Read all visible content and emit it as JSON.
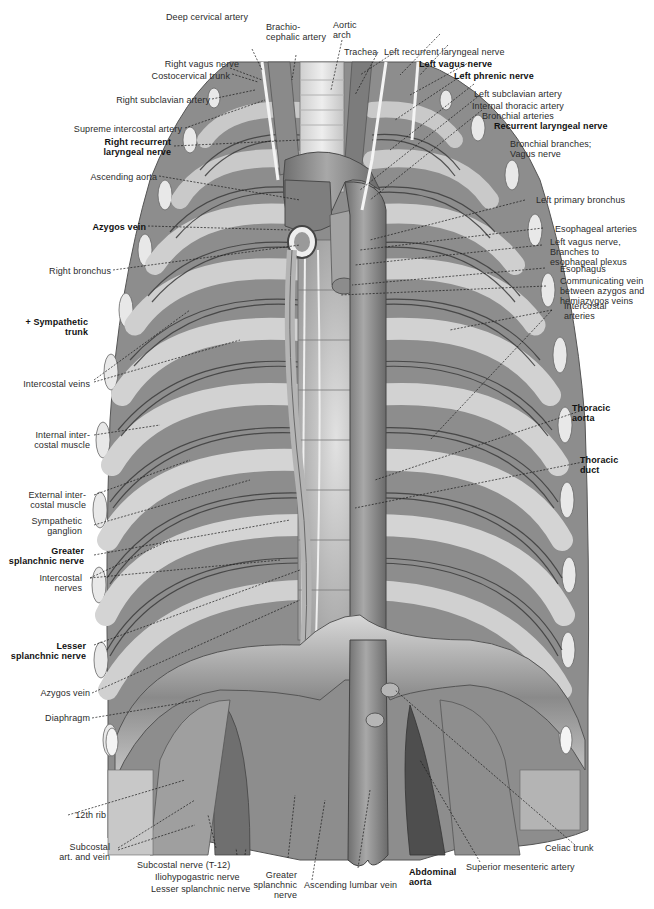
{
  "figure": {
    "colors": {
      "background": "#ffffff",
      "label_text": "#2b2b2b",
      "bold_label_text": "#111111",
      "leader_line": "#1a1a1a",
      "tissue_dark": "#5a5a5a",
      "tissue_mid": "#9a9a9a",
      "tissue_light": "#d4d4d4",
      "vessel": "#8c8c8c",
      "nerve": "#f2f2f2"
    }
  },
  "labels": {
    "top": [
      {
        "id": "deep-cervical-artery",
        "text": "Deep cervical artery",
        "bold": false
      },
      {
        "id": "brachiocephalic-artery",
        "text": "Brachio-\ncephalic artery",
        "bold": false
      },
      {
        "id": "aortic-arch",
        "text": "Aortic\narch",
        "bold": false
      },
      {
        "id": "trachea",
        "text": "Trachea",
        "bold": false
      },
      {
        "id": "left-recurrent-laryngeal-nerve",
        "text": "Left recurrent laryngeal nerve",
        "bold": false
      }
    ],
    "left": [
      {
        "id": "right-vagus-nerve",
        "text": "Right vagus nerve",
        "bold": false
      },
      {
        "id": "costocervical-trunk",
        "text": "Costocervical trunk",
        "bold": false
      },
      {
        "id": "right-subclavian-artery",
        "text": "Right subclavian artery",
        "bold": false
      },
      {
        "id": "supreme-intercostal-artery",
        "text": "Supreme intercostal artery",
        "bold": false
      },
      {
        "id": "right-recurrent-laryngeal-nerve",
        "text": "Right recurrent\nlaryngeal nerve",
        "bold": true
      },
      {
        "id": "ascending-aorta",
        "text": "Ascending aorta",
        "bold": false
      },
      {
        "id": "azygos-vein-upper",
        "text": "Azygos vein",
        "bold": true
      },
      {
        "id": "right-bronchus",
        "text": "Right bronchus",
        "bold": false
      },
      {
        "id": "sympathetic-trunk",
        "text": "+ Sympathetic\ntrunk",
        "bold": true
      },
      {
        "id": "intercostal-veins",
        "text": "Intercostal veins",
        "bold": false
      },
      {
        "id": "internal-intercostal-muscle",
        "text": "Internal inter-\ncostal muscle",
        "bold": false
      },
      {
        "id": "external-intercostal-muscle",
        "text": "External inter-\ncostal muscle",
        "bold": false
      },
      {
        "id": "sympathetic-ganglion",
        "text": "Sympathetic\nganglion",
        "bold": false
      },
      {
        "id": "greater-splanchnic-nerve",
        "text": "Greater\nsplanchnic nerve",
        "bold": true
      },
      {
        "id": "intercostal-nerves",
        "text": "Intercostal\nnerves",
        "bold": false
      },
      {
        "id": "lesser-splanchnic-nerve",
        "text": "Lesser\nsplanchnic nerve",
        "bold": true
      },
      {
        "id": "azygos-vein-lower",
        "text": "Azygos vein",
        "bold": false
      },
      {
        "id": "diaphragm",
        "text": "Diaphragm",
        "bold": false
      },
      {
        "id": "12th-rib",
        "text": "12th rib",
        "bold": false
      },
      {
        "id": "subcostal-art-and-vein",
        "text": "Subcostal\nart. and vein",
        "bold": false
      }
    ],
    "right": [
      {
        "id": "left-vagus-nerve",
        "text": "Left vagus nerve",
        "bold": true
      },
      {
        "id": "left-phrenic-nerve",
        "text": "Left phrenic nerve",
        "bold": true
      },
      {
        "id": "left-subclavian-artery",
        "text": "Left subclavian artery",
        "bold": false
      },
      {
        "id": "internal-thoracic-artery",
        "text": "Internal thoracic artery",
        "bold": false
      },
      {
        "id": "bronchial-arteries",
        "text": "Bronchial arteries",
        "bold": false
      },
      {
        "id": "recurrent-laryngeal-nerve",
        "text": "Recurrent laryngeal nerve",
        "bold": true
      },
      {
        "id": "bronchial-branches-vagus",
        "text": "Bronchial branches;\nVagus nerve",
        "bold": false
      },
      {
        "id": "left-primary-bronchus",
        "text": "Left primary bronchus",
        "bold": false
      },
      {
        "id": "esophageal-arteries",
        "text": "Esophageal arteries",
        "bold": false
      },
      {
        "id": "left-vagus-esophageal-plexus",
        "text": "Left vagus nerve,\nBranches to\nesophageal plexus",
        "bold": false
      },
      {
        "id": "esophagus",
        "text": "Esophagus",
        "bold": false
      },
      {
        "id": "communicating-vein",
        "text": "Communicating vein\nbetween azygos and\nhemiazygos veins",
        "bold": false
      },
      {
        "id": "intercostal-arteries",
        "text": "Intercostal\narteries",
        "bold": false
      },
      {
        "id": "thoracic-aorta",
        "text": "Thoracic\naorta",
        "bold": true
      },
      {
        "id": "thoracic-duct",
        "text": "Thoracic\nduct",
        "bold": true
      },
      {
        "id": "celiac-trunk",
        "text": "Celiac trunk",
        "bold": false
      }
    ],
    "bottom": [
      {
        "id": "subcostal-nerve",
        "text": "Subcostal nerve (T-12)",
        "bold": false
      },
      {
        "id": "iliohypogastric-nerve",
        "text": "Iliohypogastric nerve",
        "bold": false
      },
      {
        "id": "lesser-splanchnic-nerve-bottom",
        "text": "Lesser splanchnic nerve",
        "bold": false
      },
      {
        "id": "greater-splanchnic-nerve-bottom",
        "text": "Greater\nsplanchnic\nnerve",
        "bold": false
      },
      {
        "id": "ascending-lumbar-vein",
        "text": "Ascending lumbar vein",
        "bold": false
      },
      {
        "id": "abdominal-aorta",
        "text": "Abdominal\naorta",
        "bold": true
      },
      {
        "id": "superior-mesenteric-artery",
        "text": "Superior mesenteric artery",
        "bold": false
      }
    ]
  }
}
